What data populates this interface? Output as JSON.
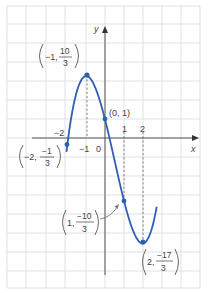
{
  "chart_data": {
    "type": "line",
    "title": "",
    "function": "y = (2x^3 - 3x^2 - 12x + 3) / 3",
    "xlabel": "x",
    "ylabel": "y",
    "xlim": [
      -5.3,
      4.9
    ],
    "ylim": [
      -8.0,
      7.2
    ],
    "grid": true,
    "x_tick_labels": [
      "-2",
      "-1",
      "0",
      "1",
      "2"
    ],
    "series": [
      {
        "name": "curve",
        "color": "#2f5fb3",
        "x_range": [
          -2.05,
          2.75
        ]
      }
    ],
    "points": [
      {
        "x": -2,
        "y": -0.3333,
        "label_whole": "-2",
        "label_num": "-1",
        "label_den": "3"
      },
      {
        "x": -1,
        "y": 3.3333,
        "label_whole": "-1",
        "label_num": "10",
        "label_den": "3"
      },
      {
        "x": 0,
        "y": 1,
        "label": "(0, 1)"
      },
      {
        "x": 1,
        "y": -3.3333,
        "label_whole": "1",
        "label_num": "-10",
        "label_den": "3"
      },
      {
        "x": 2,
        "y": -5.6667,
        "label_whole": "2",
        "label_num": "-17",
        "label_den": "3"
      }
    ],
    "annotations": [
      "dashed vertical guides at x = -1, 1, 2",
      "arrow from label (1, -10/3) to point"
    ]
  },
  "labels": {
    "x_axis": "x",
    "y_axis": "y",
    "tick_neg2": "−2",
    "tick_neg1": "−1",
    "tick_0": "0",
    "tick_1": "1",
    "tick_2": "2",
    "p_max_whole": "−1,",
    "p_max_num": "10",
    "p_max_den": "3",
    "p_yint": "(0, 1)",
    "p_left_whole": "−2,",
    "p_left_num": "−1",
    "p_left_den": "3",
    "p_infl_whole": "1,",
    "p_infl_num": "−10",
    "p_infl_den": "3",
    "p_min_whole": "2,",
    "p_min_num": "−17",
    "p_min_den": "3"
  },
  "colors": {
    "curve": "#2f5fb3",
    "grid": "#d6d6d6",
    "axis": "#555555",
    "text": "#444444"
  }
}
